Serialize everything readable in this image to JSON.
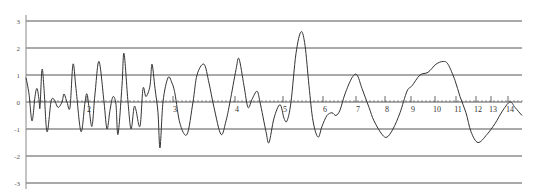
{
  "chart_data": {
    "type": "line",
    "title": "",
    "xlabel": "",
    "ylabel": "",
    "ylim": [
      -3,
      3
    ],
    "grid": true,
    "legend": null,
    "y_ticks": [
      3,
      2,
      1,
      0,
      -1,
      -2,
      -3
    ],
    "y_tick_labels": [
      "3",
      "2",
      "1",
      "0",
      "-1",
      "-2",
      "-3"
    ],
    "x_tick_labels": [
      "2",
      "3",
      "4",
      "5",
      "6",
      "7",
      "8",
      "9",
      "10",
      "11",
      "12",
      "13",
      "14"
    ],
    "x_tick_pixel_positions": [
      89,
      175,
      237,
      285,
      325,
      358,
      387,
      413,
      437,
      458,
      478,
      493,
      510
    ],
    "series": [
      {
        "name": "waveform",
        "color": "#333333",
        "points_px_x": [
          26,
          29,
          32,
          35,
          37,
          39,
          40,
          42,
          44,
          47,
          51,
          54,
          58,
          62,
          64,
          67,
          70,
          73,
          76,
          81,
          85,
          87,
          89,
          92,
          95,
          99,
          104,
          107,
          110,
          113,
          116,
          118,
          122,
          124,
          128,
          131,
          134,
          136,
          140,
          143,
          146,
          150,
          152,
          155,
          158,
          160,
          163,
          168,
          172,
          175,
          180,
          187,
          193,
          197,
          204,
          209,
          214,
          221,
          226,
          230,
          236,
          239,
          244,
          248,
          252,
          257,
          260,
          266,
          269,
          274,
          280,
          284,
          287,
          291,
          296,
          301,
          305,
          309,
          313,
          318,
          322,
          327,
          332,
          336,
          340,
          345,
          352,
          357,
          362,
          369,
          374,
          382,
          387,
          393,
          400,
          407,
          412,
          420,
          428,
          436,
          443,
          448,
          455,
          460,
          466,
          471,
          478,
          487,
          495,
          503,
          510,
          515,
          522
        ],
        "values": [
          0.9,
          0.3,
          -0.7,
          0.2,
          0.5,
          0.1,
          -0.2,
          1.2,
          0.5,
          -1.1,
          0.0,
          0.1,
          -0.2,
          0.0,
          0.3,
          0.0,
          -0.2,
          1.4,
          0.5,
          -1.1,
          0.0,
          0.3,
          -0.2,
          -0.9,
          0.3,
          1.5,
          0.0,
          -1.0,
          -0.3,
          0.2,
          -0.1,
          -1.2,
          0.6,
          1.8,
          0.0,
          -1.0,
          -0.2,
          -0.3,
          -0.9,
          0.5,
          0.2,
          0.6,
          1.4,
          0.5,
          -0.4,
          -1.7,
          0.0,
          0.9,
          0.7,
          0.3,
          -0.8,
          -1.2,
          0.0,
          1.0,
          1.4,
          0.7,
          -0.2,
          -1.2,
          -0.7,
          0.0,
          1.2,
          1.6,
          0.6,
          -0.2,
          0.1,
          0.4,
          0.0,
          -1.1,
          -1.5,
          -0.6,
          -0.1,
          -0.6,
          -0.7,
          0.0,
          1.8,
          2.6,
          2.1,
          0.6,
          -0.7,
          -1.3,
          -0.9,
          -0.5,
          -0.4,
          -0.5,
          -0.3,
          0.3,
          0.9,
          1.0,
          0.5,
          -0.2,
          -0.7,
          -1.2,
          -1.3,
          -1.0,
          -0.4,
          0.4,
          0.6,
          1.0,
          1.1,
          1.4,
          1.5,
          1.4,
          0.8,
          0.2,
          -0.4,
          -1.1,
          -1.5,
          -1.2,
          -0.8,
          -0.3,
          0.0,
          -0.2,
          -0.5
        ]
      }
    ],
    "layout": {
      "axis_x_px": 26,
      "right_px": 522,
      "zero_y_px": 102,
      "px_per_unit_y": 27,
      "gridline_color": "#555555",
      "line_color": "#333333"
    }
  }
}
